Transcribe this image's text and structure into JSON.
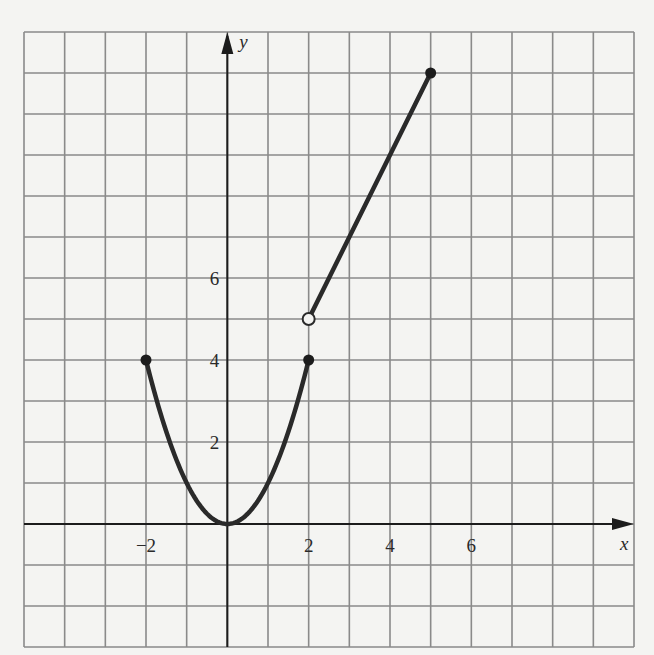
{
  "chart_data": {
    "type": "line",
    "title": "",
    "xlabel": "x",
    "ylabel": "y",
    "xlim": [
      -5,
      10
    ],
    "ylim": [
      -3,
      12
    ],
    "grid": true,
    "grid_step": 1,
    "legend": null,
    "x_tick_labels": [
      {
        "value": -2,
        "text": "−2"
      },
      {
        "value": 2,
        "text": "2"
      },
      {
        "value": 4,
        "text": "4"
      },
      {
        "value": 6,
        "text": "6"
      }
    ],
    "y_tick_labels": [
      {
        "value": 2,
        "text": "2"
      },
      {
        "value": 4,
        "text": "4"
      },
      {
        "value": 6,
        "text": "6"
      }
    ],
    "series": [
      {
        "name": "y = x^2 on [-2, 2]",
        "kind": "curve",
        "function": "x^2",
        "domain": [
          -2,
          2
        ],
        "sample_points": [
          [
            -2,
            4
          ],
          [
            -1.5,
            2.25
          ],
          [
            -1,
            1
          ],
          [
            -0.5,
            0.25
          ],
          [
            0,
            0
          ],
          [
            0.5,
            0.25
          ],
          [
            1,
            1
          ],
          [
            1.5,
            2.25
          ],
          [
            2,
            4
          ]
        ]
      },
      {
        "name": "y = 2x + 1 on (2, 5]",
        "kind": "segment",
        "function": "2x+1",
        "domain": [
          2,
          5
        ],
        "sample_points": [
          [
            2,
            5
          ],
          [
            5,
            11
          ]
        ]
      }
    ],
    "markers": [
      {
        "x": -2,
        "y": 4,
        "style": "closed"
      },
      {
        "x": 2,
        "y": 4,
        "style": "closed"
      },
      {
        "x": 2,
        "y": 5,
        "style": "open"
      },
      {
        "x": 5,
        "y": 11,
        "style": "closed"
      }
    ]
  },
  "colors": {
    "background": "#f4f4f2",
    "grid": "#8a8a8a",
    "axis": "#1c1c1c",
    "curve": "#2a2a2a"
  },
  "layout_px": {
    "left": 24,
    "top": 32,
    "right": 634,
    "bottom": 647
  }
}
